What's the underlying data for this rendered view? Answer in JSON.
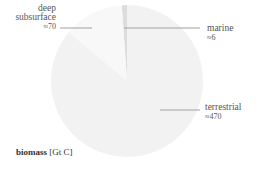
{
  "chart_data": {
    "type": "pie",
    "title": "biomass [Gt C]",
    "categories": [
      "terrestrial",
      "deep subsurface",
      "marine"
    ],
    "values": [
      470,
      70,
      6
    ],
    "value_labels": [
      "≈470",
      "≈70",
      "≈6"
    ],
    "colors": [
      "#f2f2f2",
      "#f8f8f8",
      "#dcdcdc"
    ],
    "legend": "none (leader-line labels)"
  },
  "labels": {
    "deep_line1": "deep",
    "deep_line2": "subsurface",
    "deep_value": "≈70",
    "marine": "marine",
    "marine_value": "≈6",
    "terrestrial": "terrestrial",
    "terrestrial_value": "≈470",
    "title_bold": "biomass",
    "title_unit": " [Gt C]"
  }
}
